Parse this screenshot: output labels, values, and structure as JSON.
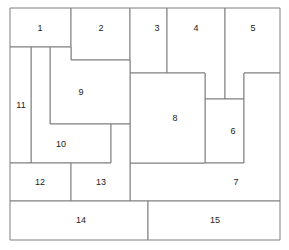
{
  "diagram": {
    "title": "",
    "stroke_color": "#7f7f7f",
    "fill_color": "#ffffff",
    "label_color": "#222222",
    "regions": [
      {
        "id": "1",
        "label": "1",
        "points": "10,8 71,8 71,47 10,47",
        "lx": 40,
        "ly": 29
      },
      {
        "id": "2",
        "label": "2",
        "points": "71,8 130,8 130,60 71,60",
        "lx": 101,
        "ly": 29
      },
      {
        "id": "3",
        "label": "3",
        "points": "130,8 167,8 167,73 130,73",
        "lx": 157,
        "ly": 29
      },
      {
        "id": "4",
        "label": "4",
        "points": "167,8 225,8 225,99 205,99 205,73 167,73",
        "lx": 196,
        "ly": 29
      },
      {
        "id": "5",
        "label": "5",
        "points": "225,8 280,8 280,73 244,73 244,99 225,99",
        "lx": 253,
        "ly": 29
      },
      {
        "id": "6",
        "label": "6",
        "points": "205,99 244,99 244,163 205,163",
        "lx": 233,
        "ly": 132
      },
      {
        "id": "7",
        "label": "7",
        "points": "244,73 280,73 280,201 130,201 130,163 244,163",
        "lx": 236,
        "ly": 183
      },
      {
        "id": "8",
        "label": "8",
        "points": "130,73 205,73 205,163 130,163",
        "lx": 175,
        "ly": 119
      },
      {
        "id": "9",
        "label": "9",
        "points": "50,47 71,47 71,60 130,60 130,124 50,124",
        "lx": 81,
        "ly": 93
      },
      {
        "id": "10",
        "label": "10",
        "points": "31,47 50,47 50,124 111,124 111,163 31,163",
        "lx": 61,
        "ly": 145
      },
      {
        "id": "11",
        "label": "11",
        "points": "10,47 31,47 31,163 10,163",
        "lx": 21,
        "ly": 106
      },
      {
        "id": "12",
        "label": "12",
        "points": "10,163 71,163 71,201 10,201",
        "lx": 40,
        "ly": 183
      },
      {
        "id": "13",
        "label": "13",
        "points": "111,124 130,124 130,201 71,201 71,163 111,163",
        "lx": 101,
        "ly": 183
      },
      {
        "id": "14",
        "label": "14",
        "points": "10,201 148,201 148,240 10,240",
        "lx": 81,
        "ly": 221
      },
      {
        "id": "15",
        "label": "15",
        "points": "148,201 280,201 280,240 148,240",
        "lx": 215,
        "ly": 221
      }
    ]
  }
}
